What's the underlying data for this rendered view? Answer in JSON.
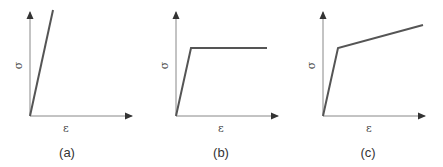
{
  "figure": {
    "panels": [
      {
        "id": "a",
        "caption": "(a)",
        "xlabel": "ε",
        "ylabel": "σ",
        "model": "linear elastic",
        "curve": [
          [
            0,
            0
          ],
          [
            23,
            106
          ]
        ]
      },
      {
        "id": "b",
        "caption": "(b)",
        "xlabel": "ε",
        "ylabel": "σ",
        "model": "elastic-perfectly plastic",
        "curve": [
          [
            0,
            0
          ],
          [
            15,
            68
          ],
          [
            91,
            68
          ]
        ]
      },
      {
        "id": "c",
        "caption": "(c)",
        "xlabel": "ε",
        "ylabel": "σ",
        "model": "elastic-linear hardening",
        "curve": [
          [
            0,
            0
          ],
          [
            15,
            68
          ],
          [
            100,
            91
          ]
        ]
      }
    ],
    "colors": {
      "axis": "#555555",
      "curve": "#555555",
      "text": "#444444"
    }
  }
}
